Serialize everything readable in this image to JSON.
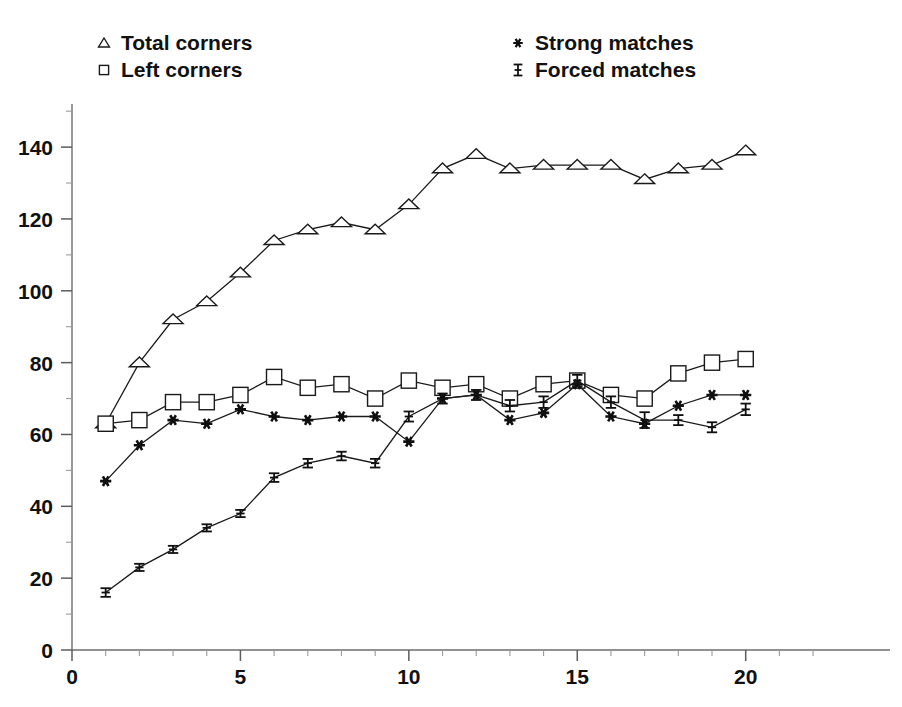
{
  "chart_data": {
    "type": "line",
    "title": "",
    "subtitle": "",
    "xlabel": "",
    "ylabel": "",
    "xlim": [
      0,
      22.8
    ],
    "ylim": [
      0,
      152
    ],
    "grid": false,
    "legend_position": "top-inside",
    "x_ticks": [
      0,
      5,
      10,
      15,
      20
    ],
    "x_tick_labels": [
      "0",
      "5",
      "10",
      "15",
      "20"
    ],
    "x_minor_ticks": [
      1,
      2,
      3,
      4,
      6,
      7,
      8,
      9,
      11,
      12,
      13,
      14,
      16,
      17,
      18,
      19,
      21,
      22
    ],
    "y_ticks": [
      0,
      20,
      40,
      60,
      80,
      100,
      120,
      140
    ],
    "y_tick_labels": [
      "0",
      "20",
      "40",
      "60",
      "80",
      "100",
      "120",
      "140"
    ],
    "y_minor_ticks": [
      10,
      30,
      50,
      70,
      90,
      110,
      130,
      150
    ],
    "x": [
      1,
      2,
      3,
      4,
      5,
      6,
      7,
      8,
      9,
      10,
      11,
      12,
      13,
      14,
      15,
      16,
      17,
      18,
      19,
      20
    ],
    "series": [
      {
        "name": "Total corners",
        "marker": "open-triangle",
        "color": "#1a1a1a",
        "values": [
          63,
          80,
          92,
          97,
          105,
          114,
          117,
          119,
          117,
          124,
          134,
          138,
          134,
          135,
          135,
          135,
          131,
          134,
          135,
          139
        ]
      },
      {
        "name": "Left corners",
        "marker": "open-square",
        "color": "#1a1a1a",
        "values": [
          63,
          64,
          69,
          69,
          71,
          76,
          73,
          74,
          70,
          75,
          73,
          74,
          70,
          74,
          75,
          71,
          70,
          77,
          80,
          81
        ]
      },
      {
        "name": "Strong matches",
        "marker": "solid-star",
        "color": "#101010",
        "values": [
          47,
          57,
          64,
          63,
          67,
          65,
          64,
          65,
          65,
          58,
          70,
          71,
          64,
          66,
          74,
          65,
          63,
          68,
          71,
          71
        ]
      },
      {
        "name": "Forced matches",
        "marker": "error-bar",
        "color": "#101010",
        "values": [
          16,
          23,
          28,
          34,
          38,
          48,
          52,
          54,
          52,
          65,
          70,
          71,
          68,
          69,
          75,
          69,
          64,
          64,
          62,
          67
        ],
        "errors": [
          1.2,
          1.0,
          1.0,
          1.0,
          1.0,
          1.2,
          1.2,
          1.2,
          1.2,
          1.4,
          1.4,
          1.4,
          1.6,
          1.6,
          1.6,
          1.6,
          2.2,
          1.4,
          1.4,
          1.6
        ]
      }
    ]
  },
  "legend": {
    "entries": [
      {
        "label": "Total corners",
        "marker": "open-triangle"
      },
      {
        "label": "Left corners",
        "marker": "open-square"
      },
      {
        "label": "Strong matches",
        "marker": "solid-star"
      },
      {
        "label": "Forced matches",
        "marker": "error-bar"
      }
    ]
  }
}
